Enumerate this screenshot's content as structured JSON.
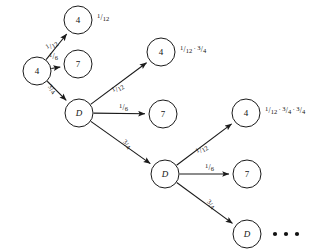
{
  "figure": {
    "type": "tree-diagram",
    "background_color": "#ffffff",
    "stroke_color": "#1a1a1a",
    "text_color": "#111111"
  },
  "nodes": [
    {
      "id": "root",
      "label": "4",
      "style": "upright",
      "cx": 37,
      "cy": 71,
      "r": 14
    },
    {
      "id": "n1-4",
      "label": "4",
      "style": "upright",
      "cx": 78,
      "cy": 20,
      "r": 14
    },
    {
      "id": "n1-7",
      "label": "7",
      "style": "upright",
      "cx": 78,
      "cy": 64,
      "r": 14
    },
    {
      "id": "n1-D",
      "label": "D",
      "style": "italic",
      "cx": 79,
      "cy": 113,
      "r": 14
    },
    {
      "id": "n2-4",
      "label": "4",
      "style": "upright",
      "cx": 161,
      "cy": 52,
      "r": 14
    },
    {
      "id": "n2-7",
      "label": "7",
      "style": "upright",
      "cx": 163,
      "cy": 114,
      "r": 14
    },
    {
      "id": "n2-D",
      "label": "D",
      "style": "italic",
      "cx": 165,
      "cy": 174,
      "r": 14
    },
    {
      "id": "n3-4",
      "label": "4",
      "style": "upright",
      "cx": 246,
      "cy": 113,
      "r": 14
    },
    {
      "id": "n3-7",
      "label": "7",
      "style": "upright",
      "cx": 247,
      "cy": 174,
      "r": 14
    },
    {
      "id": "n3-D",
      "label": "D",
      "style": "italic",
      "cx": 247,
      "cy": 234,
      "r": 14
    }
  ],
  "edges": [
    {
      "id": "e-root-4",
      "from": "root",
      "to": "n1-4",
      "probability": {
        "numerator": "1",
        "denominator": "12"
      },
      "label_x": 46,
      "label_y": 41,
      "rotation": -31
    },
    {
      "id": "e-root-7",
      "from": "root",
      "to": "n1-7",
      "probability": {
        "numerator": "1",
        "denominator": "6"
      },
      "label_x": 49,
      "label_y": 52,
      "rotation": 0
    },
    {
      "id": "e-root-D",
      "from": "root",
      "to": "n1-D",
      "probability": {
        "numerator": "3",
        "denominator": "4"
      },
      "label_x": 47,
      "label_y": 85,
      "rotation": 40
    },
    {
      "id": "e-d1-4",
      "from": "n1-D",
      "to": "n2-4",
      "probability": {
        "numerator": "1",
        "denominator": "12"
      },
      "label_x": 112,
      "label_y": 84,
      "rotation": -31
    },
    {
      "id": "e-d1-7",
      "from": "n1-D",
      "to": "n2-7",
      "probability": {
        "numerator": "1",
        "denominator": "6"
      },
      "label_x": 119,
      "label_y": 103,
      "rotation": 0
    },
    {
      "id": "e-d1-D",
      "from": "n1-D",
      "to": "n2-D",
      "probability": {
        "numerator": "3",
        "denominator": "4"
      },
      "label_x": 122,
      "label_y": 140,
      "rotation": 38
    },
    {
      "id": "e-d2-4",
      "from": "n2-D",
      "to": "n3-4",
      "probability": {
        "numerator": "1",
        "denominator": "12"
      },
      "label_x": 196,
      "label_y": 145,
      "rotation": -31
    },
    {
      "id": "e-d2-7",
      "from": "n2-D",
      "to": "n3-7",
      "probability": {
        "numerator": "1",
        "denominator": "6"
      },
      "label_x": 205,
      "label_y": 163,
      "rotation": 0
    },
    {
      "id": "e-d2-D",
      "from": "n2-D",
      "to": "n3-D",
      "probability": {
        "numerator": "3",
        "denominator": "4"
      },
      "label_x": 206,
      "label_y": 200,
      "rotation": 38
    }
  ],
  "result_labels": [
    {
      "id": "result-level-1",
      "for_node": "n1-4",
      "x": 97,
      "y": 13,
      "terms": [
        {
          "numerator": "1",
          "denominator": "12"
        }
      ]
    },
    {
      "id": "result-level-2",
      "for_node": "n2-4",
      "x": 180,
      "y": 45,
      "terms": [
        {
          "numerator": "1",
          "denominator": "12"
        },
        {
          "numerator": "3",
          "denominator": "4"
        }
      ]
    },
    {
      "id": "result-level-3",
      "for_node": "n3-4",
      "x": 265,
      "y": 106,
      "terms": [
        {
          "numerator": "1",
          "denominator": "12"
        },
        {
          "numerator": "3",
          "denominator": "4"
        },
        {
          "numerator": "3",
          "denominator": "4"
        }
      ]
    }
  ],
  "ellipsis": {
    "id": "continuation-dots",
    "count": 3,
    "start_x": 275,
    "y": 234,
    "spacing": 11,
    "radius": 2.1
  },
  "separator_symbol": "·"
}
